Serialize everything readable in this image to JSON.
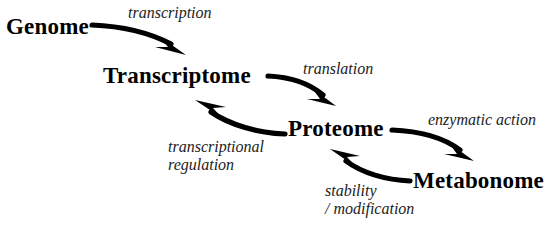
{
  "diagram": {
    "background_color": "#ffffff",
    "node_color": "#000000",
    "edge_color": "#000000",
    "label_color": "#222222",
    "nodes": [
      {
        "id": "genome",
        "label": "Genome"
      },
      {
        "id": "transcriptome",
        "label": "Transcriptome"
      },
      {
        "id": "proteome",
        "label": "Proteome"
      },
      {
        "id": "metabonome",
        "label": "Metabonome"
      }
    ],
    "edges": [
      {
        "id": "transcription",
        "from": "genome",
        "to": "transcriptome",
        "label": "transcription",
        "label_line2": ""
      },
      {
        "id": "translation",
        "from": "transcriptome",
        "to": "proteome",
        "label": "translation",
        "label_line2": ""
      },
      {
        "id": "enzymatic",
        "from": "proteome",
        "to": "metabonome",
        "label": "enzymatic action",
        "label_line2": ""
      },
      {
        "id": "transreg",
        "from": "proteome",
        "to": "transcriptome",
        "label": "transcriptional",
        "label_line2": "regulation"
      },
      {
        "id": "stability",
        "from": "metabonome",
        "to": "proteome",
        "label": "stability",
        "label_line2": "/ modification"
      }
    ]
  }
}
